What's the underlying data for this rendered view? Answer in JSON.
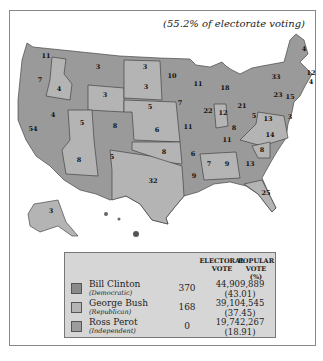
{
  "subtitle": "(55.2% of electorate voting)",
  "colors": {
    "democratic": "#8a8a8a",
    "republican": "#b4b4b4",
    "independent": "#9c9c9c",
    "background": "#ffffff",
    "legend_bg": "#d6d6d6"
  },
  "legend": {
    "col_electoral": "ELECTORAL VOTE",
    "col_electoral_l1": "ELECTORAL",
    "col_electoral_l2": "VOTE",
    "col_popular_l1": "POPULAR VOTE",
    "col_popular_l2": "(%)",
    "rows": [
      {
        "candidate": "Bill Clinton",
        "party": "(Democratic)",
        "electoral": "370",
        "popular": "44,909,889",
        "percent": "(43.01)"
      },
      {
        "candidate": "George Bush",
        "party": "(Republican)",
        "electoral": "168",
        "popular": "39,104,545",
        "percent": "(37.45)"
      },
      {
        "candidate": "Ross Perot",
        "party": "(Independent)",
        "electoral": "0",
        "popular": "19,742,267",
        "percent": "(18.91)"
      }
    ]
  },
  "states": [
    {
      "label": "11",
      "x": 46,
      "y": 58
    },
    {
      "label": "7",
      "x": 40,
      "y": 82
    },
    {
      "label": "4",
      "x": 59,
      "y": 91
    },
    {
      "label": "3",
      "x": 98,
      "y": 69
    },
    {
      "label": "3",
      "x": 105,
      "y": 97
    },
    {
      "label": "3",
      "x": 145,
      "y": 69
    },
    {
      "label": "3",
      "x": 146,
      "y": 89
    },
    {
      "label": "10",
      "x": 172,
      "y": 78
    },
    {
      "label": "11",
      "x": 198,
      "y": 86
    },
    {
      "label": "18",
      "x": 225,
      "y": 90
    },
    {
      "label": "33",
      "x": 276,
      "y": 79
    },
    {
      "label": "4",
      "x": 304,
      "y": 51
    },
    {
      "label": "23",
      "x": 278,
      "y": 97
    },
    {
      "label": "54",
      "x": 33,
      "y": 131
    },
    {
      "label": "4",
      "x": 53,
      "y": 117
    },
    {
      "label": "5",
      "x": 82,
      "y": 125
    },
    {
      "label": "8",
      "x": 115,
      "y": 128
    },
    {
      "label": "5",
      "x": 150,
      "y": 109
    },
    {
      "label": "6",
      "x": 157,
      "y": 132
    },
    {
      "label": "7",
      "x": 180,
      "y": 105
    },
    {
      "label": "11",
      "x": 188,
      "y": 129
    },
    {
      "label": "22",
      "x": 208,
      "y": 113
    },
    {
      "label": "12",
      "x": 223,
      "y": 115
    },
    {
      "label": "21",
      "x": 242,
      "y": 108
    },
    {
      "label": "5",
      "x": 254,
      "y": 118
    },
    {
      "label": "13",
      "x": 268,
      "y": 121
    },
    {
      "label": "8",
      "x": 234,
      "y": 130
    },
    {
      "label": "11",
      "x": 227,
      "y": 142
    },
    {
      "label": "14",
      "x": 270,
      "y": 137
    },
    {
      "label": "8",
      "x": 79,
      "y": 162
    },
    {
      "label": "5",
      "x": 112,
      "y": 159
    },
    {
      "label": "8",
      "x": 164,
      "y": 154
    },
    {
      "label": "6",
      "x": 193,
      "y": 156
    },
    {
      "label": "8",
      "x": 262,
      "y": 152
    },
    {
      "label": "7",
      "x": 209,
      "y": 166
    },
    {
      "label": "9",
      "x": 227,
      "y": 166
    },
    {
      "label": "13",
      "x": 250,
      "y": 166
    },
    {
      "label": "32",
      "x": 153,
      "y": 183
    },
    {
      "label": "9",
      "x": 194,
      "y": 178
    },
    {
      "label": "25",
      "x": 266,
      "y": 195
    },
    {
      "label": "3",
      "x": 51,
      "y": 213
    },
    {
      "label": "12",
      "x": 311,
      "y": 75
    },
    {
      "label": "4",
      "x": 311,
      "y": 84
    },
    {
      "label": "15",
      "x": 290,
      "y": 99
    },
    {
      "label": "3",
      "x": 290,
      "y": 119
    }
  ]
}
